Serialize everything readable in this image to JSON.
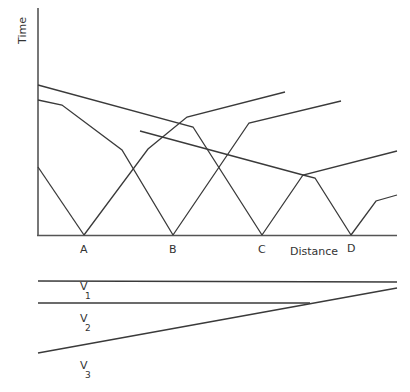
{
  "diagram": {
    "axes": {
      "y_label": "Time",
      "x_label": "Distance"
    },
    "stations": [
      {
        "label": "A",
        "x": 84
      },
      {
        "label": "B",
        "x": 173
      },
      {
        "label": "C",
        "x": 262
      },
      {
        "label": "D",
        "x": 351
      }
    ],
    "travel_time_curves": [
      {
        "id": "reverse-from-C",
        "points": "38,85 193,127 262,235"
      },
      {
        "id": "reverse-from-B",
        "points": "38,100 62,105 122,150 173,235"
      },
      {
        "id": "forward-from-A-left",
        "points": "38,167 84,235"
      },
      {
        "id": "forward-from-A",
        "points": "84,235 148,149 187,117 285,92"
      },
      {
        "id": "reverse-from-D",
        "points": "140,131 303,175 315,178 351,235"
      },
      {
        "id": "forward-from-B",
        "points": "173,235 249,123 341,101"
      },
      {
        "id": "forward-from-C",
        "points": "262,235 303,175 397,151"
      },
      {
        "id": "forward-from-D",
        "points": "351,235 376,201 397,195"
      }
    ],
    "layers": {
      "labels": [
        {
          "text": "V",
          "sub": "1",
          "x": 80,
          "y": 290
        },
        {
          "text": "V",
          "sub": "2",
          "x": 80,
          "y": 323
        },
        {
          "text": "V",
          "sub": "3",
          "x": 80,
          "y": 370
        }
      ],
      "boundaries": [
        {
          "id": "surface",
          "points": "38,281 397,282"
        },
        {
          "id": "interface-1",
          "points": "38,303 310,303"
        },
        {
          "id": "interface-2-dipping",
          "points": "38,353 397,288"
        }
      ]
    }
  }
}
